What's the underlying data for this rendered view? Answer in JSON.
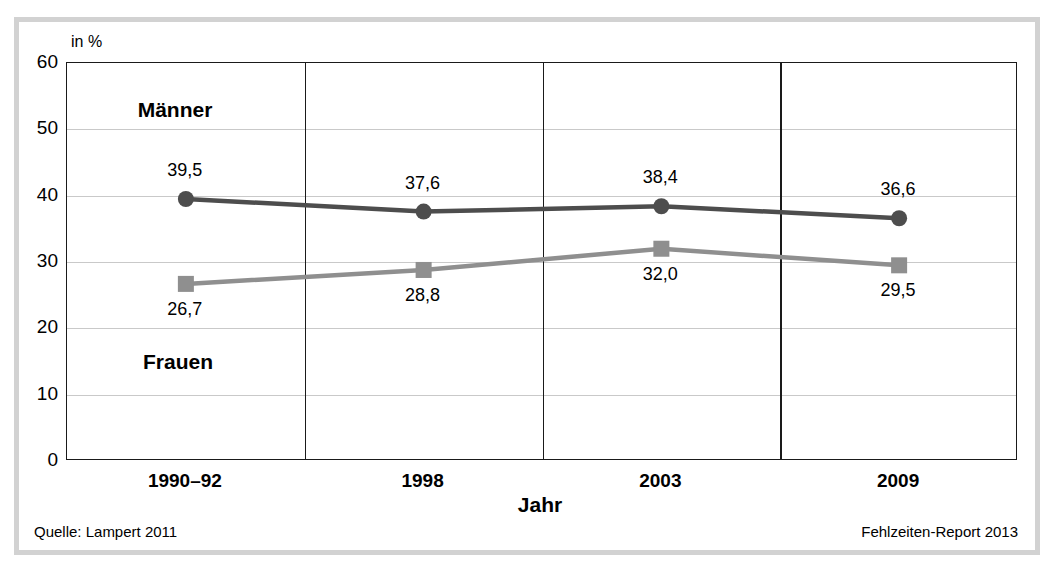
{
  "chart_data": {
    "type": "line",
    "title": "",
    "subtitle": "",
    "xlabel": "Jahr",
    "ylabel": "",
    "yunit": "in %",
    "categories": [
      "1990–92",
      "1998",
      "2003",
      "2009"
    ],
    "yticks": [
      0,
      10,
      20,
      30,
      40,
      50,
      60
    ],
    "ylim": [
      0,
      60
    ],
    "grid": "horizontal-gridlines-and-category-separators",
    "legend_position": "in-plot-labels",
    "series": [
      {
        "name": "Männer",
        "marker": "circle",
        "color": "#4d4d4d",
        "values": [
          39.5,
          37.6,
          38.4,
          36.6
        ],
        "labels": [
          "39,5",
          "37,6",
          "38,4",
          "36,6"
        ],
        "label_position": "above"
      },
      {
        "name": "Frauen",
        "marker": "square",
        "color": "#8f8f8f",
        "values": [
          26.7,
          28.8,
          32.0,
          29.5
        ],
        "labels": [
          "26,7",
          "28,8",
          "32,0",
          "29,5"
        ],
        "label_position": "below-except-2003"
      }
    ]
  },
  "plot": {
    "series_label_maenner": "Männer",
    "series_label_frauen": "Frauen",
    "axis_unit": "in %"
  },
  "footer": {
    "source": "Quelle: Lampert 2011",
    "report": "Fehlzeiten-Report 2013"
  },
  "colors": {
    "maenner": "#4d4d4d",
    "frauen": "#8f8f8f",
    "axis": "#1a1a1a",
    "gridline": "#c9c9c9",
    "frame": "#d2d2d2"
  }
}
